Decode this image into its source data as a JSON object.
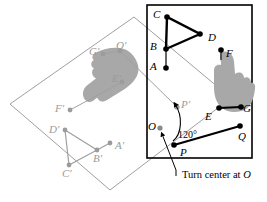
{
  "figure": {
    "caption": "Turn center at ",
    "caption_point": "O",
    "angle_label": "120°",
    "colors": {
      "ink": "#000000",
      "image_gray": "#9b9b9b",
      "hand_fill": "#a8a8a8",
      "background": "#ffffff"
    },
    "frame": {
      "x": 147,
      "y": 5,
      "width": 105,
      "height": 153
    }
  },
  "original_labels": [
    {
      "id": "A",
      "text": "A",
      "x": 150,
      "y": 52
    },
    {
      "id": "B",
      "text": "B",
      "x": 150,
      "y": 36
    },
    {
      "id": "C",
      "text": "C",
      "x": 153,
      "y": 8
    },
    {
      "id": "D",
      "text": "D",
      "x": 209,
      "y": 34
    },
    {
      "id": "E",
      "text": "E",
      "x": 203,
      "y": 112
    },
    {
      "id": "F",
      "text": "F",
      "x": 225,
      "y": 44
    },
    {
      "id": "G",
      "text": "G",
      "x": 236,
      "y": 109
    },
    {
      "id": "O",
      "text": "O",
      "x": 148,
      "y": 119
    },
    {
      "id": "P",
      "text": "P",
      "x": 180,
      "y": 146
    },
    {
      "id": "Q",
      "text": "Q",
      "x": 235,
      "y": 131
    },
    {
      "id": "Pp",
      "text": "P′",
      "x": 172,
      "y": 99
    }
  ],
  "image_labels": [
    {
      "id": "Ap",
      "text": "A′",
      "x": 112,
      "y": 142
    },
    {
      "id": "Bp",
      "text": "B′",
      "x": 88,
      "y": 150
    },
    {
      "id": "Cp",
      "text": "C′",
      "x": 60,
      "y": 166
    },
    {
      "id": "Dp",
      "text": "D′",
      "x": 42,
      "y": 124
    },
    {
      "id": "Ep",
      "text": "E′",
      "x": 109,
      "y": 74
    },
    {
      "id": "Fp",
      "text": "F′",
      "x": 53,
      "y": 100
    },
    {
      "id": "Gp",
      "text": "G′",
      "x": 89,
      "y": 53
    },
    {
      "id": "Qp",
      "text": "Q′",
      "x": 113,
      "y": 37
    }
  ],
  "points_original": {
    "A": [
      166,
      68
    ],
    "B": [
      166,
      49
    ],
    "C": [
      167,
      17
    ],
    "D": [
      200,
      34
    ],
    "E": [
      219,
      108
    ],
    "F": [
      221,
      50
    ],
    "G": [
      241,
      107
    ],
    "O": [
      160,
      128
    ],
    "P": [
      174,
      145
    ],
    "Q": [
      240,
      126
    ],
    "Pprime": [
      177,
      107
    ]
  },
  "points_image": {
    "Aprime": [
      110,
      143
    ],
    "Bprime": [
      97,
      150
    ],
    "Cprime": [
      69,
      165
    ],
    "Dprime": [
      65,
      130
    ],
    "Eprime": [
      122,
      82
    ],
    "Fprime": [
      70,
      110
    ],
    "Gprime": [
      103,
      54
    ],
    "Qprime": [
      120,
      51
    ]
  },
  "shapes": {
    "triangle_original": [
      "C",
      "B",
      "D"
    ],
    "segment_original": [
      "A",
      "B"
    ],
    "segment_pq": [
      "P",
      "Q"
    ],
    "segment_eg": [
      "E",
      "G"
    ],
    "triangle_image": [
      "D′",
      "B′",
      "C′"
    ],
    "segment_image": [
      "A′",
      "B′"
    ],
    "segment_image_qg": [
      "Q′",
      "G′"
    ],
    "rotated_rectangle": [
      [
        134,
        17
      ],
      [
        231,
        98
      ],
      [
        110,
        190
      ],
      [
        10,
        104
      ]
    ]
  }
}
